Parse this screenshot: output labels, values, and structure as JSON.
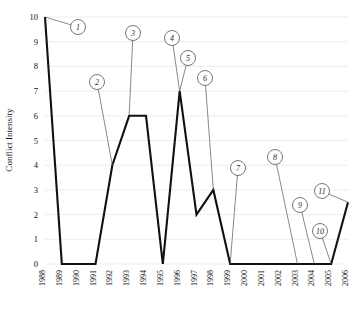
{
  "chart_data": {
    "type": "line",
    "title": "",
    "xlabel": "",
    "ylabel": "Conflict Intensity",
    "ylim": [
      0,
      10
    ],
    "yticks": [
      0,
      1,
      2,
      3,
      4,
      5,
      6,
      7,
      8,
      9,
      10
    ],
    "grid": true,
    "legend": "none",
    "categories": [
      "1988",
      "1989",
      "1990",
      "1991",
      "1992",
      "1993",
      "1994",
      "1995",
      "1996",
      "1997",
      "1998",
      "1999",
      "2000",
      "2001",
      "2002",
      "2003",
      "2004",
      "2005",
      "2006"
    ],
    "values": [
      10,
      0,
      0,
      0,
      4,
      6,
      6,
      0,
      7,
      2,
      3,
      0,
      0,
      0,
      0,
      0,
      0,
      0,
      2.5
    ],
    "series": [
      {
        "name": "Conflict Intensity",
        "values": [
          10,
          0,
          0,
          0,
          4,
          6,
          6,
          0,
          7,
          2,
          3,
          0,
          0,
          0,
          0,
          0,
          0,
          0,
          2.5
        ]
      }
    ],
    "annotations": [
      {
        "label": "1",
        "x": 1988,
        "y": 10,
        "marker_x": 78,
        "marker_y": 27
      },
      {
        "label": "2",
        "x": 1992,
        "y": 4,
        "marker_x": 97,
        "marker_y": 82
      },
      {
        "label": "3",
        "x": 1993,
        "y": 6,
        "marker_x": 133,
        "marker_y": 33
      },
      {
        "label": "4",
        "x": 1996,
        "y": 7,
        "marker_x": 172,
        "marker_y": 38
      },
      {
        "label": "5",
        "x": 1996,
        "y": 7,
        "marker_x": 188,
        "marker_y": 58
      },
      {
        "label": "6",
        "x": 1998,
        "y": 3,
        "marker_x": 205,
        "marker_y": 78
      },
      {
        "label": "7",
        "x": 1999,
        "y": 0,
        "marker_x": 238,
        "marker_y": 168
      },
      {
        "label": "8",
        "x": 2003,
        "y": 0,
        "marker_x": 275,
        "marker_y": 157
      },
      {
        "label": "9",
        "x": 2004,
        "y": 0,
        "marker_x": 300,
        "marker_y": 205
      },
      {
        "label": "10",
        "x": 2005,
        "y": 0,
        "marker_x": 320,
        "marker_y": 231
      },
      {
        "label": "11",
        "x": 2006,
        "y": 2.5,
        "marker_x": 322,
        "marker_y": 191
      }
    ]
  },
  "axis": {
    "y_title": "Conflict Intensity",
    "y_tick_labels": [
      "10",
      "9",
      "8",
      "7",
      "6",
      "5",
      "4",
      "3",
      "2",
      "1",
      "0"
    ],
    "x_tick_labels": [
      "1988",
      "1989",
      "1990",
      "1991",
      "1992",
      "1993",
      "1994",
      "1995",
      "1996",
      "1997",
      "1998",
      "1999",
      "2000",
      "2001",
      "2002",
      "2003",
      "2004",
      "2005",
      "2006"
    ]
  },
  "style": {
    "line_color": "#111111",
    "grid_color": "#e8e8ec",
    "callout_color": "#555555",
    "background": "#ffffff"
  }
}
